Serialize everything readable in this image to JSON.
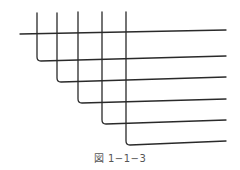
{
  "figure": {
    "caption": "図 1−1−3",
    "stroke_color": "#2a2a2a",
    "top_line": {
      "x1": 20,
      "y1": 34,
      "x2": 226,
      "y2": 30
    },
    "bent_lines": [
      {
        "x": 37,
        "top": 13,
        "corner": 61,
        "end_x": 226,
        "end_y": 56
      },
      {
        "x": 57,
        "top": 13,
        "corner": 82,
        "end_x": 226,
        "end_y": 77
      },
      {
        "x": 78,
        "top": 12,
        "corner": 103,
        "end_x": 226,
        "end_y": 99
      },
      {
        "x": 102,
        "top": 12,
        "corner": 124,
        "end_x": 226,
        "end_y": 120
      },
      {
        "x": 126,
        "top": 12,
        "corner": 145,
        "end_x": 226,
        "end_y": 141
      }
    ]
  }
}
